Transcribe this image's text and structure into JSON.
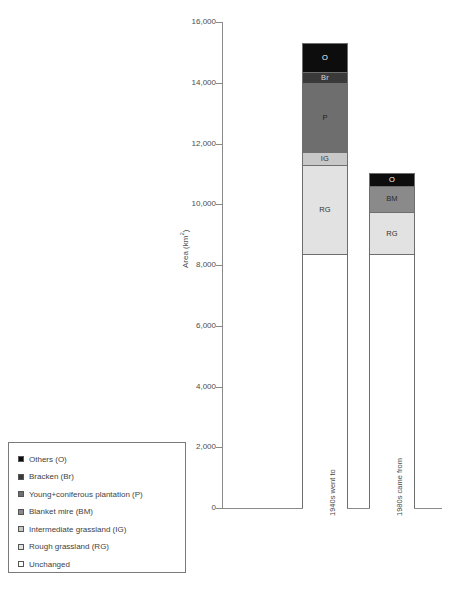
{
  "chart_data": {
    "type": "bar",
    "subtype": "stacked-bar",
    "title": "",
    "xlabel": "",
    "ylabel": "Area (km2)",
    "ylabel_display": "Area (km",
    "ylabel_sup": "2",
    "ylabel_tail": ")",
    "ylim": [
      0,
      16000
    ],
    "ytick_values": [
      0,
      2000,
      4000,
      6000,
      8000,
      10000,
      12000,
      14000,
      16000
    ],
    "ytick_labels": [
      "0",
      "2,000",
      "4,000",
      "6,000",
      "8,000",
      "10,000",
      "12,000",
      "14,000",
      "16,000"
    ],
    "grid": false,
    "legend_position": "bottom-left-outside",
    "categories": [
      "1940s went to",
      "1980s came from"
    ],
    "series": [
      {
        "name": "Unchanged",
        "code": "",
        "color": "#ffffff",
        "values": [
          8350,
          8350
        ]
      },
      {
        "name": "Rough grassland (RG)",
        "code": "RG",
        "color": "#e2e2e2",
        "values": [
          2950,
          1400
        ]
      },
      {
        "name": "Intermediate grassland (IG)",
        "code": "IG",
        "color": "#c8c8c8",
        "values": [
          430,
          0
        ]
      },
      {
        "name": "Blanket mire (BM)",
        "code": "BM",
        "color": "#8a8a8a",
        "values": [
          0,
          860
        ]
      },
      {
        "name": "Young+coniferous plantation (P)",
        "code": "P",
        "color": "#6e6e6e",
        "values": [
          2270,
          0
        ]
      },
      {
        "name": "Bracken (Br)",
        "code": "Br",
        "color": "#3a3a3a",
        "values": [
          360,
          0
        ]
      },
      {
        "name": "Others (O)",
        "code": "O",
        "color": "#0d0d0d",
        "values": [
          960,
          420
        ]
      }
    ],
    "bar_totals": [
      15320,
      11030
    ],
    "bars": [
      {
        "category": "1940s went to",
        "segments": [
          {
            "code": "",
            "label": "",
            "value": 8350,
            "y0": 0,
            "y1": 8350,
            "color": "#ffffff",
            "text_color": "#333333"
          },
          {
            "code": "RG",
            "label": "RG",
            "value": 2950,
            "y0": 8350,
            "y1": 11300,
            "color": "#e2e2e2",
            "text_color": "#333333"
          },
          {
            "code": "IG",
            "label": "IG",
            "value": 430,
            "y0": 11300,
            "y1": 11730,
            "color": "#c8c8c8",
            "text_color": "#333333"
          },
          {
            "code": "P",
            "label": "P",
            "value": 2270,
            "y0": 11730,
            "y1": 14000,
            "color": "#6e6e6e",
            "text_color": "#1f1f1f"
          },
          {
            "code": "Br",
            "label": "Br",
            "value": 360,
            "y0": 14000,
            "y1": 14360,
            "color": "#3a3a3a",
            "text_color": "#d8d8d8"
          },
          {
            "code": "O",
            "label": "O",
            "value": 960,
            "y0": 14360,
            "y1": 15320,
            "color": "#0d0d0d",
            "text_color": "#ffffff"
          }
        ]
      },
      {
        "category": "1980s came from",
        "segments": [
          {
            "code": "",
            "label": "",
            "value": 8350,
            "y0": 0,
            "y1": 8350,
            "color": "#ffffff",
            "text_color": "#333333"
          },
          {
            "code": "RG",
            "label": "RG",
            "value": 1400,
            "y0": 8350,
            "y1": 9750,
            "color": "#e2e2e2",
            "text_color": "#333333"
          },
          {
            "code": "BM",
            "label": "BM",
            "value": 860,
            "y0": 9750,
            "y1": 10610,
            "color": "#8a8a8a",
            "text_color": "#2a2a2a"
          },
          {
            "code": "O",
            "label": "O",
            "value": 420,
            "y0": 10610,
            "y1": 11030,
            "color": "#0d0d0d",
            "text_color": "#ffffff"
          }
        ]
      }
    ]
  },
  "legend": {
    "items": [
      {
        "label": "Others (O)",
        "color": "#0d0d0d"
      },
      {
        "label": "Bracken (Br)",
        "color": "#3a3a3a"
      },
      {
        "label": "Young+coniferous plantation (P)",
        "color": "#6e6e6e"
      },
      {
        "label": "Blanket mire (BM)",
        "color": "#8a8a8a"
      },
      {
        "label": "Intermediate grassland (IG)",
        "color": "#c8c8c8"
      },
      {
        "label": "Rough grassland (RG)",
        "color": "#e2e2e2"
      },
      {
        "label": "Unchanged",
        "color": "#ffffff"
      }
    ]
  }
}
